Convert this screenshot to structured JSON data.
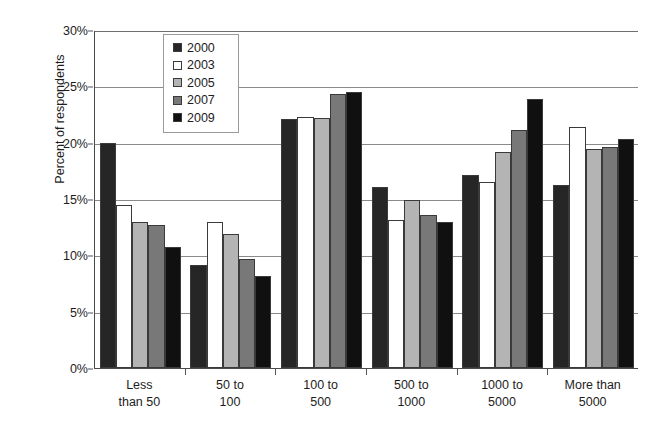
{
  "chart_data": {
    "type": "bar",
    "title": "",
    "xlabel": "",
    "ylabel": "Percent of respondents",
    "ylim": [
      0,
      30
    ],
    "ytick_labels": [
      "0%",
      "5%",
      "10%",
      "15%",
      "20%",
      "25%",
      "30%"
    ],
    "ytick_values": [
      0,
      5,
      10,
      15,
      20,
      25,
      30
    ],
    "grid": true,
    "legend_position": "top-center-inside",
    "categories": [
      "Less\nthan 50",
      "50 to\n100",
      "100 to\n500",
      "500 to\n1000",
      "1000 to\n5000",
      "More than\n5000"
    ],
    "series": [
      {
        "name": "2000",
        "color": "#262626",
        "values": [
          20.0,
          9.1,
          22.1,
          16.1,
          17.1,
          16.2
        ]
      },
      {
        "name": "2003",
        "color": "#ffffff",
        "values": [
          14.5,
          13.0,
          22.3,
          13.1,
          16.5,
          21.4
        ]
      },
      {
        "name": "2005",
        "color": "#b4b4b4",
        "values": [
          13.0,
          11.9,
          22.2,
          14.9,
          19.2,
          19.4
        ]
      },
      {
        "name": "2007",
        "color": "#787878",
        "values": [
          12.7,
          9.7,
          24.3,
          13.6,
          21.1,
          19.6
        ]
      },
      {
        "name": "2009",
        "color": "#101010",
        "values": [
          10.7,
          8.2,
          24.5,
          13.0,
          23.9,
          20.3
        ]
      }
    ]
  }
}
